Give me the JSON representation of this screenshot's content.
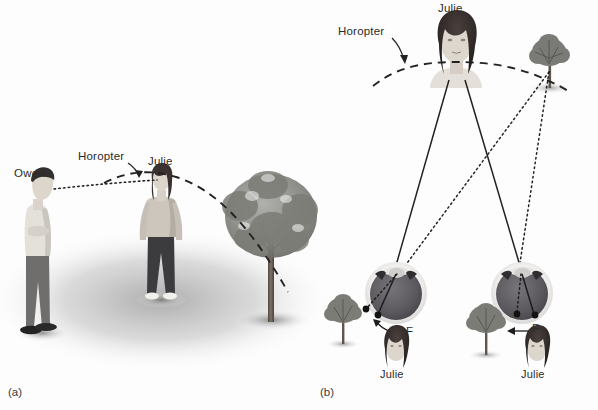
{
  "figure": {
    "background_color": "#fdfdfd",
    "ink_color": "#1c1c1c"
  },
  "panel_a": {
    "tag": "(a)",
    "labels": {
      "owen": "Owen",
      "horopter": "Horopter",
      "julie": "Julie"
    },
    "scene": {
      "ground_shadow": "#b8b8b8",
      "figures": [
        {
          "name": "owen",
          "pose": "profile-facing-right",
          "shirt": "#e2ded8",
          "pants": "#6f6e6c",
          "hair": "#2f2c2a",
          "shoes": "#262626"
        },
        {
          "name": "julie",
          "pose": "front-facing",
          "top": "#cfc8bf",
          "pants": "#3b3a3c",
          "hair": "#3a3230",
          "shoes": "#f2f0ec"
        }
      ],
      "tree": {
        "canopy": "#8d8d8b",
        "trunk": "#6b6258"
      },
      "horopter_curve": "dashed-arc-through-julie",
      "sight_line": "dotted-line-owen-to-julie"
    }
  },
  "panel_b": {
    "tag": "(b)",
    "labels": {
      "julie_top": "Julie",
      "horopter": "Horopter",
      "fovea_left": "F",
      "fovea_right": "F",
      "julie_left_inset": "Julie",
      "julie_right_inset": "Julie"
    },
    "scene": {
      "fixation_target": "julie-face",
      "peripheral_target": "tree",
      "eyes": [
        {
          "name": "left-eye",
          "sclera": "#efeeec",
          "vitreous": "#5c5a5c",
          "lens": "#d8d7d5"
        },
        {
          "name": "right-eye",
          "sclera": "#efeeec",
          "vitreous": "#5c5a5c",
          "lens": "#d8d7d5"
        }
      ],
      "rays": [
        {
          "from": "julie",
          "style": "solid",
          "meaning": "fixation rays to both foveas"
        },
        {
          "from": "tree",
          "style": "dotted",
          "meaning": "rays from tree to non-corresponding retinal points"
        }
      ],
      "retinal_images": [
        {
          "eye": "left-eye",
          "items": [
            "tree",
            "julie"
          ],
          "order_left_to_right": [
            "tree",
            "julie"
          ]
        },
        {
          "eye": "right-eye",
          "items": [
            "tree",
            "julie"
          ],
          "order_left_to_right": [
            "tree",
            "julie"
          ]
        }
      ]
    }
  }
}
